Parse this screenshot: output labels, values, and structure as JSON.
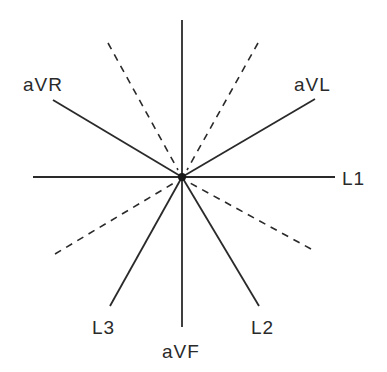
{
  "diagram": {
    "type": "hexaxial reference system",
    "center": [
      182,
      177
    ],
    "leads": [
      {
        "id": "L1",
        "label": "L1",
        "x1": 33,
        "y1": 177,
        "x2": 335,
        "y2": 177,
        "label_pos": [
          342,
          185
        ]
      },
      {
        "id": "aVF",
        "label": "aVF",
        "x1": 182,
        "y1": 20,
        "x2": 182,
        "y2": 327,
        "label_pos": [
          162,
          358
        ]
      },
      {
        "id": "aVR",
        "label": "aVR",
        "x1": 53,
        "y1": 100,
        "x2": 182,
        "y2": 177,
        "label_pos": [
          23,
          91
        ]
      },
      {
        "id": "aVL",
        "label": "aVL",
        "x1": 182,
        "y1": 177,
        "x2": 315,
        "y2": 99,
        "label_pos": [
          294,
          91
        ]
      },
      {
        "id": "L3",
        "label": "L3",
        "x1": 182,
        "y1": 177,
        "x2": 110,
        "y2": 306,
        "label_pos": [
          92,
          334
        ]
      },
      {
        "id": "L2",
        "label": "L2",
        "x1": 182,
        "y1": 177,
        "x2": 259,
        "y2": 306,
        "label_pos": [
          251,
          334
        ]
      }
    ],
    "dashed_extensions": [
      {
        "id": "dash-upper-left",
        "x1": 108,
        "y1": 43,
        "x2": 178,
        "y2": 170
      },
      {
        "id": "dash-upper-right",
        "x1": 258,
        "y1": 43,
        "x2": 187,
        "y2": 170
      },
      {
        "id": "dash-lower-left",
        "x1": 55,
        "y1": 254,
        "x2": 174,
        "y2": 183
      },
      {
        "id": "dash-lower-right",
        "x1": 311,
        "y1": 249,
        "x2": 190,
        "y2": 183
      }
    ]
  }
}
